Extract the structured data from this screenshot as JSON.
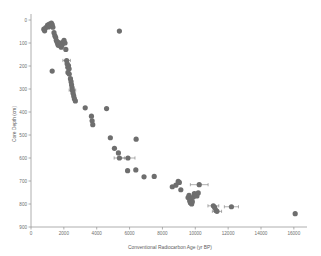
{
  "chart_data": {
    "type": "scatter",
    "title": "",
    "xlabel": "Conventional Radiocarbon Age (yr BP)",
    "ylabel": "Core Depth (cm)",
    "xlim": [
      0,
      16800
    ],
    "ylim": [
      0,
      900
    ],
    "y_inverted": true,
    "grid": false,
    "legend": null,
    "xticks": [
      0,
      2000,
      4000,
      6000,
      8000,
      10000,
      12000,
      14000,
      16000
    ],
    "xtick_labels": [
      "0",
      "2000",
      "4000",
      "6000",
      "8000",
      "10000",
      "12000",
      "14000",
      "16000"
    ],
    "yticks": [
      0,
      100,
      200,
      300,
      400,
      500,
      600,
      700,
      800,
      900
    ],
    "ytick_labels": [
      "0",
      "100",
      "200",
      "300",
      "400",
      "500",
      "600",
      "700",
      "800",
      "900"
    ],
    "marker_color": "#6e6e6e",
    "marker_size": 2.6,
    "series": [
      {
        "name": "Radiocarbon dates",
        "points": [
          {
            "x": 780,
            "y": 40,
            "xerr": 0
          },
          {
            "x": 830,
            "y": 47,
            "xerr": 0
          },
          {
            "x": 900,
            "y": 33,
            "xerr": 0
          },
          {
            "x": 1010,
            "y": 22,
            "xerr": 0
          },
          {
            "x": 1060,
            "y": 30,
            "xerr": 0
          },
          {
            "x": 1120,
            "y": 18,
            "xerr": 0
          },
          {
            "x": 1180,
            "y": 25,
            "xerr": 0
          },
          {
            "x": 1240,
            "y": 14,
            "xerr": 0
          },
          {
            "x": 1290,
            "y": 20,
            "xerr": 0
          },
          {
            "x": 1330,
            "y": 31,
            "xerr": 0
          },
          {
            "x": 1400,
            "y": 55,
            "xerr": 0
          },
          {
            "x": 1450,
            "y": 68,
            "xerr": 0
          },
          {
            "x": 1500,
            "y": 75,
            "xerr": 0
          },
          {
            "x": 1540,
            "y": 88,
            "xerr": 0
          },
          {
            "x": 1580,
            "y": 95,
            "xerr": 0
          },
          {
            "x": 1620,
            "y": 102,
            "xerr": 0
          },
          {
            "x": 1660,
            "y": 110,
            "xerr": 0
          },
          {
            "x": 1700,
            "y": 98,
            "xerr": 0
          },
          {
            "x": 1740,
            "y": 105,
            "xerr": 0
          },
          {
            "x": 1790,
            "y": 112,
            "xerr": 0
          },
          {
            "x": 1840,
            "y": 118,
            "xerr": 0
          },
          {
            "x": 1900,
            "y": 108,
            "xerr": 0
          },
          {
            "x": 1960,
            "y": 96,
            "xerr": 0
          },
          {
            "x": 2010,
            "y": 88,
            "xerr": 0
          },
          {
            "x": 2070,
            "y": 100,
            "xerr": 0
          },
          {
            "x": 2120,
            "y": 128,
            "xerr": 0
          },
          {
            "x": 1290,
            "y": 222,
            "xerr": 0
          },
          {
            "x": 2170,
            "y": 176,
            "xerr": 230
          },
          {
            "x": 2200,
            "y": 190,
            "xerr": 0
          },
          {
            "x": 2240,
            "y": 205,
            "xerr": 0
          },
          {
            "x": 2280,
            "y": 198,
            "xerr": 0
          },
          {
            "x": 2320,
            "y": 212,
            "xerr": 0
          },
          {
            "x": 2250,
            "y": 228,
            "xerr": 0
          },
          {
            "x": 2330,
            "y": 235,
            "xerr": 0
          },
          {
            "x": 2400,
            "y": 255,
            "xerr": 0
          },
          {
            "x": 2440,
            "y": 268,
            "xerr": 0
          },
          {
            "x": 2470,
            "y": 282,
            "xerr": 0
          },
          {
            "x": 2500,
            "y": 294,
            "xerr": 0
          },
          {
            "x": 2520,
            "y": 305,
            "xerr": 200
          },
          {
            "x": 2560,
            "y": 318,
            "xerr": 0
          },
          {
            "x": 2600,
            "y": 330,
            "xerr": 0
          },
          {
            "x": 2640,
            "y": 342,
            "xerr": 0
          },
          {
            "x": 2700,
            "y": 352,
            "xerr": 0
          },
          {
            "x": 3300,
            "y": 382,
            "xerr": 0
          },
          {
            "x": 3680,
            "y": 418,
            "xerr": 0
          },
          {
            "x": 3720,
            "y": 438,
            "xerr": 0
          },
          {
            "x": 3760,
            "y": 455,
            "xerr": 0
          },
          {
            "x": 4600,
            "y": 385,
            "xerr": 0
          },
          {
            "x": 5380,
            "y": 48,
            "xerr": 0
          },
          {
            "x": 4830,
            "y": 512,
            "xerr": 0
          },
          {
            "x": 5080,
            "y": 558,
            "xerr": 0
          },
          {
            "x": 5320,
            "y": 578,
            "xerr": 0
          },
          {
            "x": 5380,
            "y": 600,
            "xerr": 320
          },
          {
            "x": 5900,
            "y": 600,
            "xerr": 430
          },
          {
            "x": 5880,
            "y": 655,
            "xerr": 0
          },
          {
            "x": 6400,
            "y": 518,
            "xerr": 0
          },
          {
            "x": 6380,
            "y": 652,
            "xerr": 0
          },
          {
            "x": 6880,
            "y": 682,
            "xerr": 0
          },
          {
            "x": 7500,
            "y": 680,
            "xerr": 0
          },
          {
            "x": 8600,
            "y": 725,
            "xerr": 0
          },
          {
            "x": 8820,
            "y": 718,
            "xerr": 0
          },
          {
            "x": 8960,
            "y": 702,
            "xerr": 0
          },
          {
            "x": 9030,
            "y": 706,
            "xerr": 0
          },
          {
            "x": 9120,
            "y": 738,
            "xerr": 0
          },
          {
            "x": 9560,
            "y": 772,
            "xerr": 0
          },
          {
            "x": 9620,
            "y": 762,
            "xerr": 0
          },
          {
            "x": 9660,
            "y": 786,
            "xerr": 0
          },
          {
            "x": 9700,
            "y": 795,
            "xerr": 0
          },
          {
            "x": 9740,
            "y": 778,
            "xerr": 0
          },
          {
            "x": 9780,
            "y": 800,
            "xerr": 0
          },
          {
            "x": 9820,
            "y": 790,
            "xerr": 0
          },
          {
            "x": 9880,
            "y": 770,
            "xerr": 0
          },
          {
            "x": 9940,
            "y": 755,
            "xerr": 0
          },
          {
            "x": 10020,
            "y": 758,
            "xerr": 0
          },
          {
            "x": 10100,
            "y": 765,
            "xerr": 0
          },
          {
            "x": 10180,
            "y": 752,
            "xerr": 0
          },
          {
            "x": 10240,
            "y": 716,
            "xerr": 540
          },
          {
            "x": 11100,
            "y": 808,
            "xerr": 330
          },
          {
            "x": 11180,
            "y": 815,
            "xerr": 0
          },
          {
            "x": 11260,
            "y": 828,
            "xerr": 0
          },
          {
            "x": 11320,
            "y": 832,
            "xerr": 280
          },
          {
            "x": 12200,
            "y": 812,
            "xerr": 430
          },
          {
            "x": 16080,
            "y": 842,
            "xerr": 0
          }
        ]
      }
    ]
  },
  "axes": {
    "x_title": "Conventional Radiocarbon Age (yr BP)",
    "y_title": "Core Depth (cm)"
  }
}
